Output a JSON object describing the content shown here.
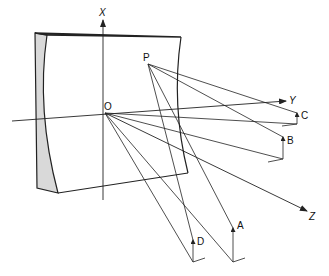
{
  "figure": {
    "type": "geometric optics diagram",
    "axes": {
      "x": {
        "label": "X"
      },
      "y": {
        "label": "Y"
      },
      "z": {
        "label": "Z"
      }
    },
    "points": {
      "origin": {
        "label": "O"
      },
      "p": {
        "label": "P"
      },
      "a": {
        "label": "A"
      },
      "b": {
        "label": "B"
      },
      "c": {
        "label": "C"
      },
      "d": {
        "label": "D"
      }
    },
    "colors": {
      "line": "#222222",
      "frame_shade": "#d9d9d9",
      "background": "#ffffff"
    }
  }
}
